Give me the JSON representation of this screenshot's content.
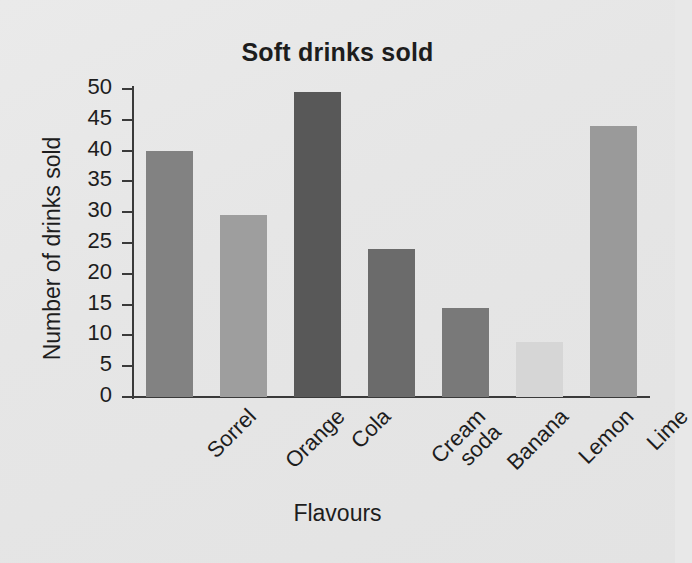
{
  "chart_data": {
    "type": "bar",
    "title": "Soft drinks sold",
    "xlabel": "Flavours",
    "ylabel": "Number of drinks sold",
    "categories": [
      "Sorrel",
      "Orange",
      "Cola",
      "Cream\nsoda",
      "Banana",
      "Lemon",
      "Lime"
    ],
    "values": [
      40,
      29.5,
      49.5,
      24,
      14.5,
      9,
      44
    ],
    "ylim": [
      0,
      50
    ],
    "yticks": [
      0,
      5,
      10,
      15,
      20,
      25,
      30,
      35,
      40,
      45,
      50
    ],
    "ytick_labels": [
      "0",
      "5",
      "10",
      "15",
      "20",
      "25",
      "30",
      "35",
      "40",
      "45",
      "50"
    ],
    "grid": false,
    "legend": false,
    "bar_colors": [
      "#828282",
      "#9e9e9e",
      "#585858",
      "#6b6b6b",
      "#797979",
      "#d6d6d6",
      "#9a9a9a"
    ]
  },
  "page": {
    "background_color": "#e7e7e7",
    "axis_color": "#3a3a3a",
    "text_color": "#1d1d1d"
  }
}
